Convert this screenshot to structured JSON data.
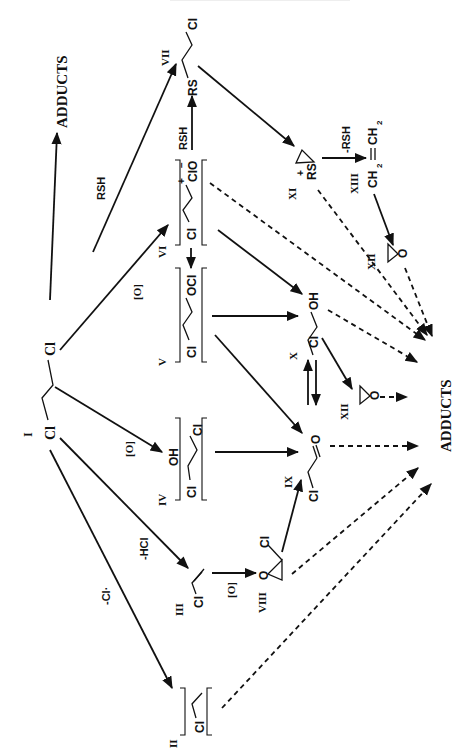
{
  "page": {
    "orientation": "rotated-90-ccw",
    "figure_type": "metabolic reaction scheme"
  },
  "compounds": {
    "I": {
      "numeral": "I",
      "formula": "Cl⁄⁄Cl",
      "atoms": [
        "Cl",
        "Cl"
      ]
    },
    "II": {
      "numeral": "II",
      "formula": "[Cl⁄·]",
      "atoms": [
        "Cl"
      ]
    },
    "III": {
      "numeral": "III",
      "formula": "Cl⁄=",
      "atoms": [
        "Cl"
      ]
    },
    "IV": {
      "numeral": "IV",
      "formula": "[Cl–CH(OH)–Cl]",
      "atoms": [
        "Cl",
        "OH",
        "Cl"
      ]
    },
    "V": {
      "numeral": "V",
      "formula": "[Cl⁄⁄OCl]",
      "atoms": [
        "Cl",
        "OCl"
      ]
    },
    "VI": {
      "numeral": "VI",
      "formula": "[Cl⁄⁄Cl⁺O⁻]",
      "atoms": [
        "Cl",
        "ClO"
      ],
      "charges": [
        "+",
        "−"
      ]
    },
    "VII": {
      "numeral": "VII",
      "formula": "RS⁄⁄Cl",
      "atoms": [
        "RS",
        "Cl"
      ]
    },
    "VIII": {
      "numeral": "VIII",
      "formula": "chloro-oxirane",
      "atoms": [
        "O",
        "Cl"
      ]
    },
    "IX": {
      "numeral": "IX",
      "formula": "Cl⁄=O",
      "atoms": [
        "Cl",
        "O"
      ]
    },
    "X": {
      "numeral": "X",
      "formula": "Cl⁄⁄OH",
      "atoms": [
        "Cl",
        "OH"
      ]
    },
    "XI": {
      "numeral": "XI",
      "formula": "RS⁺ (episulfonium)",
      "atoms": [
        "RS"
      ],
      "charges": [
        "+"
      ]
    },
    "XII": {
      "numeral": "XII",
      "formula": "oxirane",
      "atoms": [
        "O"
      ]
    },
    "XIII": {
      "numeral": "XIII",
      "formula": "CH₂=CH₂",
      "atoms": [
        "CH",
        "2",
        "CH",
        "2"
      ]
    }
  },
  "reagents": {
    "rsh_top": "RSH",
    "rsh_vi_vii": "RSH",
    "minus_rsh": "-RSH",
    "ox_vi": "[O]",
    "ox_iv": "[O]",
    "ox_viii": "[O]",
    "minus_hcl": "-HCl",
    "minus_cl_radical": "-Cl·"
  },
  "labels": {
    "adducts_top": "ADDUCTS",
    "adducts_bottom": "ADDUCTS"
  }
}
